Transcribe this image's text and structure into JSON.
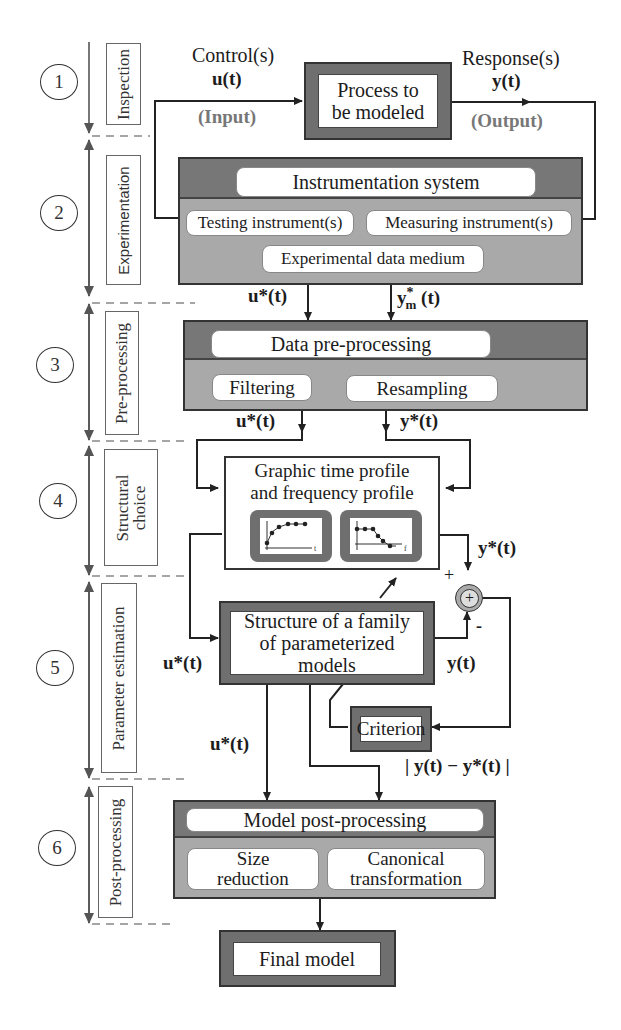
{
  "stages": [
    {
      "number": "1",
      "label": "Inspection"
    },
    {
      "number": "2",
      "label": "Experimentation"
    },
    {
      "number": "3",
      "label": "Pre-processing"
    },
    {
      "number": "4",
      "label": "Structural choice"
    },
    {
      "number": "5",
      "label": "Parameter estimation"
    },
    {
      "number": "6",
      "label": "Post-processing"
    }
  ],
  "stage4_lines": [
    "Structural",
    "choice"
  ],
  "inspection": {
    "control_label": "Control(s)",
    "control_signal": "u(t)",
    "input_label": "(Input)",
    "process_line1": "Process to",
    "process_line2": "be modeled",
    "response_label": "Response(s)",
    "response_signal": "y(t)",
    "output_label": "(Output)"
  },
  "experimentation": {
    "title": "Instrumentation system",
    "testing": "Testing instrument(s)",
    "measuring": "Measuring instrument(s)",
    "medium": "Experimental data medium",
    "out_u": "u*(t)",
    "out_y": "y",
    "out_y_sup": "*",
    "out_y_sub": "m",
    "out_y_suffix": " (t)"
  },
  "preprocessing": {
    "title": "Data pre-processing",
    "filtering": "Filtering",
    "resampling": "Resampling",
    "out_u": "u*(t)",
    "out_y": "y*(t)"
  },
  "structural": {
    "line1": "Graphic time profile",
    "line2": "and frequency profile",
    "time_axis": "t",
    "freq_axis": "f",
    "out_y": "y*(t)"
  },
  "estimation": {
    "in_u": "u*(t)",
    "model_line1": "Structure of a family",
    "model_line2": "of parameterized",
    "model_line3": "models",
    "out_y": "y(t)",
    "plus": "+",
    "minus": "-",
    "sum_symbol": "+",
    "criterion": "Criterion",
    "down_u": "u*(t)",
    "error": "| y(t) − y*(t) |"
  },
  "postprocessing": {
    "title": "Model post-processing",
    "size_line1": "Size",
    "size_line2": "reduction",
    "canon_line1": "Canonical",
    "canon_line2": "transformation"
  },
  "final": {
    "label": "Final model"
  }
}
